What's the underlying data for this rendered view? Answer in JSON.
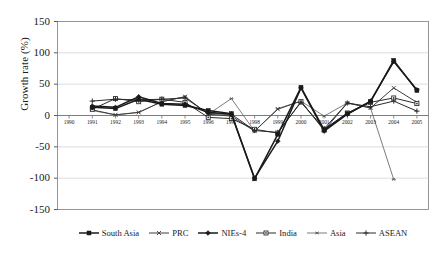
{
  "chart_data": {
    "type": "line",
    "title": "",
    "xlabel": "",
    "ylabel": "Growth rate (%)",
    "ylim": [
      -150,
      150
    ],
    "yticks": [
      150,
      100,
      50,
      0,
      -50,
      -100,
      -150
    ],
    "ytick_labels": [
      "150",
      "100",
      "50",
      "0",
      "-50",
      "-100",
      "-150"
    ],
    "grid": true,
    "grid_axis": "y",
    "legend_position": "bottom",
    "x": [
      1990,
      1991,
      1992,
      1993,
      1994,
      1995,
      1996,
      1997,
      1998,
      1999,
      2000,
      2001,
      2002,
      2003,
      2004,
      2005
    ],
    "categories": [
      "1990",
      "1991",
      "1992",
      "1993",
      "1994",
      "1995",
      "1996",
      "1997",
      "1998",
      "1999",
      "2000",
      "2001",
      "2002",
      "2003",
      "2004",
      "2005"
    ],
    "series": [
      {
        "name": "South Asia",
        "marker": "filled-square",
        "color": "#1a1a1a",
        "values": [
          null,
          13,
          11,
          26,
          18,
          16,
          8,
          3,
          -101,
          -30,
          45,
          -23,
          3,
          22,
          88,
          40
        ]
      },
      {
        "name": "PRC",
        "marker": "cross-small",
        "color": "#3d3d3d",
        "values": [
          null,
          9,
          1,
          5,
          22,
          30,
          2,
          -1,
          -25,
          10,
          23,
          -24,
          20,
          12,
          44,
          21
        ]
      },
      {
        "name": "NIEs-4",
        "marker": "filled-diamond",
        "color": "#1a1a1a",
        "values": [
          null,
          15,
          13,
          30,
          19,
          18,
          5,
          2,
          -100,
          -41,
          44,
          -25,
          2,
          23,
          86,
          41
        ]
      },
      {
        "name": "India",
        "marker": "square-outline",
        "color": "#2b2b2b",
        "values": [
          null,
          10,
          27,
          22,
          26,
          21,
          -3,
          -5,
          -22,
          -28,
          22,
          -22,
          4,
          21,
          28,
          19
        ]
      },
      {
        "name": "Asia",
        "marker": "star-small",
        "color": "#5a5a5a",
        "values": [
          null,
          8,
          1,
          5,
          22,
          30,
          2,
          27,
          -25,
          11,
          23,
          -1,
          20,
          12,
          -102,
          null
        ]
      },
      {
        "name": "ASEAN",
        "marker": "plus-cross",
        "color": "#2b2b2b",
        "values": [
          null,
          23,
          26,
          25,
          26,
          28,
          3,
          2,
          -24,
          -27,
          21,
          -21,
          20,
          14,
          23,
          7
        ]
      }
    ]
  },
  "legend": {
    "items": [
      {
        "label": "South Asia"
      },
      {
        "label": "PRC"
      },
      {
        "label": "NIEs-4"
      },
      {
        "label": "India"
      },
      {
        "label": "Asia"
      },
      {
        "label": "ASEAN"
      }
    ]
  }
}
